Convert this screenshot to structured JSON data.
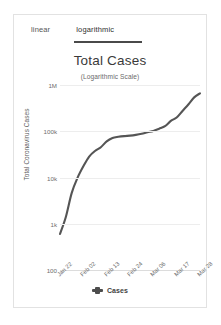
{
  "tabs": {
    "linear_label": "linear",
    "logarithmic_label": "logarithmic",
    "active": "logarithmic"
  },
  "chart_data": {
    "type": "line",
    "title": "Total Cases",
    "subtitle": "(Logarithmic Scale)",
    "xlabel": "",
    "ylabel": "Total Coronavirus Cases",
    "yscale": "log",
    "ylim": [
      100,
      1000000
    ],
    "yticks": [
      "100",
      "1k",
      "10k",
      "100k",
      "1M"
    ],
    "ytick_values": [
      100,
      1000,
      10000,
      100000,
      1000000
    ],
    "grid": true,
    "legend_position": "bottom",
    "categories": [
      "Jan 22",
      "Feb 02",
      "Feb 13",
      "Feb 24",
      "Mar 06",
      "Mar 17",
      "Mar 28"
    ],
    "xticks": [
      "Jan 22",
      "Feb 02",
      "Feb 13",
      "Feb 24",
      "Mar 06",
      "Mar 17",
      "Mar 28"
    ],
    "series": [
      {
        "name": "Cases",
        "color": "#555555",
        "x": [
          "Jan 22",
          "Jan 25",
          "Jan 28",
          "Jan 31",
          "Feb 02",
          "Feb 05",
          "Feb 08",
          "Feb 11",
          "Feb 13",
          "Feb 16",
          "Feb 19",
          "Feb 22",
          "Feb 24",
          "Feb 27",
          "Mar 01",
          "Mar 04",
          "Mar 06",
          "Mar 09",
          "Mar 12",
          "Mar 15",
          "Mar 17",
          "Mar 20",
          "Mar 23",
          "Mar 26",
          "Mar 28"
        ],
        "values": [
          600,
          1400,
          4600,
          9800,
          17400,
          28300,
          37500,
          45200,
          60300,
          71300,
          75700,
          78600,
          80400,
          83600,
          88400,
          95300,
          101800,
          113700,
          128300,
          167500,
          198200,
          275000,
          378000,
          540000,
          660000
        ]
      }
    ],
    "legend": [
      {
        "label": "Cases",
        "color": "#4d4d4d"
      }
    ]
  }
}
